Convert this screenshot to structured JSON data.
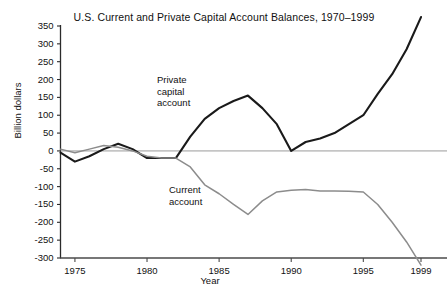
{
  "chart_data": {
    "type": "line",
    "title": "U.S. Current and Private Capital Account Balances, 1970–1999",
    "xlabel": "Year",
    "ylabel": "Billion dollars",
    "xlim": [
      1974,
      1999
    ],
    "ylim": [
      -320,
      380
    ],
    "yticks": [
      350,
      300,
      250,
      200,
      150,
      100,
      50,
      0,
      -50,
      -100,
      -150,
      -200,
      -250,
      -300
    ],
    "ytick_labels": [
      "350",
      "300",
      "250",
      "200",
      "150",
      "100",
      "50",
      "0",
      "-50",
      "-100",
      "-150",
      "-200",
      "-250",
      "-300"
    ],
    "xticks": [
      1975,
      1980,
      1985,
      1990,
      1995,
      1999
    ],
    "xtick_labels": [
      "1975",
      "1980",
      "1985",
      "1990",
      "1995",
      "1999"
    ],
    "grid": false,
    "zero_line": true,
    "legend_position": "inline-annotations",
    "x": [
      1974,
      1975,
      1976,
      1977,
      1978,
      1979,
      1980,
      1981,
      1982,
      1983,
      1984,
      1985,
      1986,
      1987,
      1988,
      1989,
      1990,
      1991,
      1992,
      1993,
      1994,
      1995,
      1996,
      1997,
      1998,
      1999
    ],
    "series": [
      {
        "name": "Private capital account",
        "color": "#1a1a1a",
        "width": 2.1,
        "values": [
          -5,
          -30,
          -15,
          5,
          20,
          5,
          -20,
          -20,
          -20,
          40,
          90,
          120,
          140,
          155,
          120,
          75,
          0,
          25,
          35,
          50,
          75,
          100,
          160,
          215,
          285,
          375
        ]
      },
      {
        "name": "Current account",
        "color": "#8c8c8c",
        "width": 1.5,
        "values": [
          5,
          -5,
          5,
          15,
          10,
          0,
          -15,
          -20,
          -20,
          -45,
          -95,
          -120,
          -150,
          -178,
          -140,
          -115,
          -110,
          -108,
          -112,
          -112,
          -113,
          -115,
          -150,
          -200,
          -255,
          -320
        ]
      }
    ],
    "annotations": [
      {
        "text_lines": [
          "Private",
          "capital",
          "account"
        ],
        "x_px": 157,
        "y_px": 74
      },
      {
        "text_lines": [
          "Current",
          "account"
        ],
        "x_px": 169,
        "y_px": 184
      }
    ]
  }
}
